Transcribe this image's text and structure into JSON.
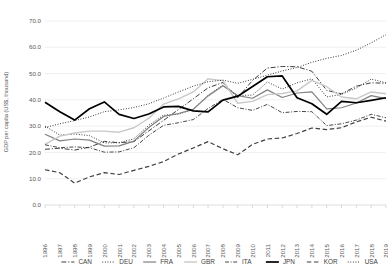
{
  "chart_data": {
    "type": "line",
    "title": "",
    "xlabel": "",
    "ylabel": "GDP per capita (US$, thousand)",
    "ylim": [
      0,
      70
    ],
    "ytick_labels": [
      "0.0",
      "10.0",
      "20.0",
      "30.0",
      "40.0",
      "50.0",
      "60.0",
      "70.0"
    ],
    "ytick_values": [
      0,
      10,
      20,
      30,
      40,
      50,
      60,
      70
    ],
    "grid": true,
    "legend_position": "bottom",
    "x": [
      1996,
      1997,
      1998,
      1999,
      2000,
      2001,
      2002,
      2003,
      2004,
      2005,
      2006,
      2007,
      2008,
      2009,
      2010,
      2011,
      2012,
      2013,
      2014,
      2015,
      2016,
      2017,
      2018,
      2019
    ],
    "categories": [
      "1996",
      "1997",
      "1998",
      "1999",
      "2000",
      "2001",
      "2002",
      "2003",
      "2004",
      "2005",
      "2006",
      "2007",
      "2008",
      "2009",
      "2010",
      "2011",
      "2012",
      "2013",
      "2014",
      "2015",
      "2016",
      "2017",
      "2018",
      "2019"
    ],
    "series": [
      {
        "name": "CAN",
        "style": "dash-dot",
        "color": "#404040",
        "width": 1.0,
        "values": [
          21.2,
          21.6,
          20.9,
          22.0,
          24.2,
          23.7,
          24.1,
          28.2,
          32.2,
          36.3,
          40.4,
          44.6,
          46.6,
          40.8,
          47.4,
          52.1,
          52.7,
          52.6,
          50.9,
          43.6,
          42.3,
          45.2,
          46.5,
          46.3
        ]
      },
      {
        "name": "DEU",
        "style": "dotted",
        "color": "#262626",
        "width": 1.0,
        "values": [
          30.0,
          26.6,
          27.0,
          26.4,
          23.6,
          23.7,
          25.2,
          30.3,
          34.2,
          34.5,
          36.4,
          41.8,
          45.6,
          41.7,
          41.8,
          46.8,
          44.1,
          46.5,
          48.0,
          41.1,
          42.1,
          44.5,
          47.9,
          46.5
        ]
      },
      {
        "name": "FRA",
        "style": "solid",
        "color": "#808080",
        "width": 1.2,
        "values": [
          26.9,
          24.4,
          25.1,
          24.7,
          22.4,
          22.5,
          24.3,
          29.5,
          33.7,
          34.8,
          36.4,
          41.5,
          45.4,
          41.6,
          40.6,
          43.8,
          40.9,
          42.6,
          43.0,
          36.6,
          37.0,
          38.8,
          41.6,
          40.5
        ]
      },
      {
        "name": "GBR",
        "style": "solid",
        "color": "#c8c8c8",
        "width": 1.4,
        "values": [
          23.1,
          26.2,
          27.4,
          28.1,
          28.1,
          27.7,
          29.4,
          33.0,
          38.4,
          40.4,
          43.0,
          48.0,
          47.3,
          38.7,
          39.4,
          42.0,
          42.4,
          43.4,
          47.4,
          45.0,
          41.1,
          40.4,
          43.0,
          42.3
        ]
      },
      {
        "name": "ITA",
        "style": "dash-dot-thin",
        "color": "#333333",
        "width": 0.9,
        "values": [
          22.9,
          21.8,
          22.1,
          21.8,
          20.1,
          20.2,
          21.8,
          26.5,
          30.3,
          31.3,
          32.5,
          36.7,
          40.2,
          37.0,
          36.0,
          38.3,
          35.1,
          35.6,
          35.5,
          30.2,
          30.9,
          32.3,
          34.5,
          33.2
        ]
      },
      {
        "name": "JPN",
        "style": "solid",
        "color": "#000000",
        "width": 1.7,
        "values": [
          39.1,
          35.5,
          32.3,
          36.6,
          39.2,
          34.5,
          32.9,
          34.6,
          37.3,
          37.5,
          35.8,
          35.4,
          39.9,
          41.4,
          45.1,
          48.8,
          49.1,
          40.8,
          38.5,
          34.5,
          39.4,
          38.9,
          39.8,
          40.8
        ]
      },
      {
        "name": "KOR",
        "style": "dashed",
        "color": "#404040",
        "width": 1.2,
        "values": [
          13.4,
          12.3,
          8.3,
          10.7,
          12.3,
          11.6,
          13.2,
          14.7,
          16.5,
          19.4,
          21.7,
          24.1,
          21.4,
          19.1,
          23.1,
          25.1,
          25.5,
          27.2,
          29.3,
          28.7,
          29.4,
          31.6,
          33.4,
          31.9
        ]
      },
      {
        "name": "USA",
        "style": "dotted",
        "color": "#262626",
        "width": 1.0,
        "values": [
          29.5,
          30.9,
          32.1,
          33.5,
          35.5,
          36.2,
          37.1,
          38.5,
          40.7,
          43.0,
          45.2,
          46.9,
          47.5,
          46.3,
          47.8,
          49.4,
          51.0,
          52.3,
          54.3,
          55.8,
          56.9,
          58.9,
          61.7,
          64.8
        ]
      }
    ]
  },
  "legend": {
    "items": [
      {
        "label": "CAN"
      },
      {
        "label": "DEU"
      },
      {
        "label": "FRA"
      },
      {
        "label": "GBR"
      },
      {
        "label": "ITA"
      },
      {
        "label": "JPN"
      },
      {
        "label": "KOR"
      },
      {
        "label": "USA"
      }
    ]
  }
}
